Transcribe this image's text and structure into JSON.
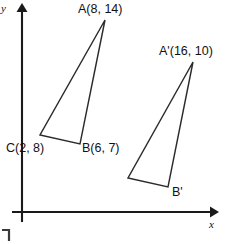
{
  "figure": {
    "kind": "coordinate-plane-triangles",
    "background_color": "#ffffff",
    "ink_color": "#2b2b2b"
  },
  "axes": {
    "x_label": "x",
    "y_label": "y",
    "origin_px": [
      22,
      212
    ],
    "x_axis_end_px": [
      214,
      212
    ],
    "y_axis_end_px": [
      22,
      6
    ],
    "color": "#1a1a1a",
    "ticks": false,
    "gridlines": false
  },
  "triangles": [
    {
      "name": "triangle-abc",
      "vertices": [
        {
          "id": "A",
          "label": "A(8, 14)",
          "coord": [
            8,
            14
          ],
          "px": [
            105,
            20
          ],
          "label_px": [
            78,
            13
          ],
          "labeled": true
        },
        {
          "id": "B",
          "label": "B(6, 7)",
          "coord": [
            6,
            7
          ],
          "px": [
            80,
            144
          ],
          "label_px": [
            82,
            152
          ],
          "labeled": true
        },
        {
          "id": "C",
          "label": "C(2, 8)",
          "coord": [
            2,
            8
          ],
          "px": [
            40,
            135
          ],
          "label_px": [
            7,
            152
          ],
          "labeled": true
        }
      ]
    },
    {
      "name": "triangle-a-prime-b-prime-c-prime",
      "vertices": [
        {
          "id": "A'",
          "label": "A'(16, 10)",
          "coord": [
            16,
            10
          ],
          "px": [
            193,
            62
          ],
          "label_px": [
            159,
            55
          ],
          "labeled": true
        },
        {
          "id": "B'",
          "label": "B'",
          "coord": null,
          "px": [
            168,
            187
          ],
          "label_px": [
            172,
            195
          ],
          "labeled": true
        },
        {
          "id": "C'",
          "label": "",
          "coord": null,
          "px": [
            128,
            178
          ],
          "label_px": null,
          "labeled": false
        }
      ]
    }
  ],
  "artifacts": {
    "corner_bracket": {
      "name": "corner-bracket-mark",
      "px": [
        3,
        228
      ]
    }
  }
}
